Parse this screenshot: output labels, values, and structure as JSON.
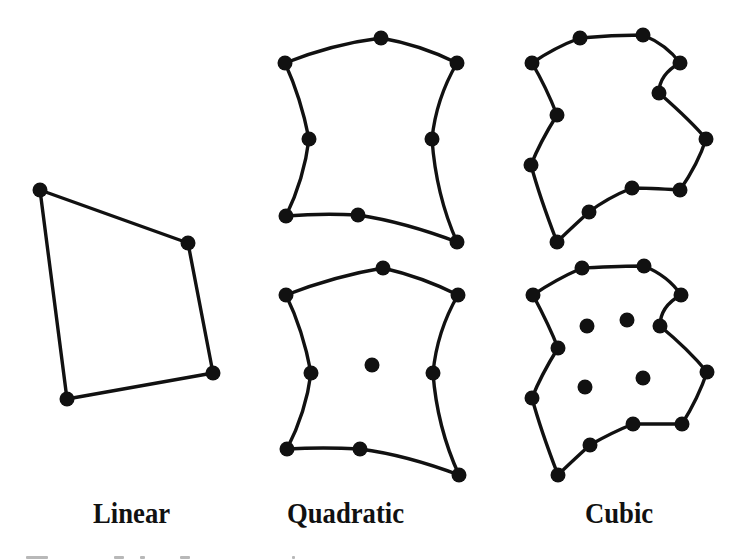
{
  "figure": {
    "stroke_color": "#111111",
    "node_color": "#111111",
    "background": "#ffffff",
    "labels": {
      "linear": "Linear",
      "quadratic": "Quadratic",
      "cubic": "Cubic"
    },
    "caption_visible": "partially cut off (illegible)"
  },
  "elements": {
    "linear": {
      "name": "Linear element (4 nodes)",
      "boundary": "40,190 188,243 213,373 67,399",
      "nodes": [
        [
          40,
          190
        ],
        [
          188,
          243
        ],
        [
          213,
          373
        ],
        [
          67,
          399
        ]
      ]
    },
    "quadratic_serendipity": {
      "name": "Quadratic element (8 nodes)",
      "boundary_path": "M285,63 Q333,44 381,38 Q421,45 457,63 Q436,99 432,139 Q436,195 457,242 Q404,222 358,215 Q322,213 286,216 Q304,179 309,139 Q301,98 285,63 Z",
      "nodes": [
        [
          285,
          63
        ],
        [
          381,
          38
        ],
        [
          457,
          63
        ],
        [
          309,
          139
        ],
        [
          432,
          139
        ],
        [
          286,
          216
        ],
        [
          358,
          215
        ],
        [
          457,
          242
        ]
      ],
      "interior_nodes": []
    },
    "quadratic_lagrange": {
      "name": "Quadratic element (9 nodes)",
      "boundary_path": "M286,295 Q335,276 383,268 Q422,277 458,295 Q437,331 433,373 Q437,427 459,475 Q406,455 360,449 Q323,447 287,449 Q306,412 311,373 Q303,330 286,295 Z",
      "nodes": [
        [
          286,
          295
        ],
        [
          383,
          268
        ],
        [
          458,
          295
        ],
        [
          311,
          373
        ],
        [
          433,
          373
        ],
        [
          287,
          449
        ],
        [
          360,
          449
        ],
        [
          459,
          475
        ]
      ],
      "interior_nodes": [
        [
          372,
          365
        ]
      ]
    },
    "cubic_serendipity": {
      "name": "Cubic element (12 nodes)",
      "boundary_path": "M532,63 C548,52 564,44 580,38 C601,36 622,35 643,35 C660,42 672,52 680,63 C667,70 659,80 659,93 C676,108 692,122 706,139 C700,158 691,174 680,190 C664,189 648,188 632,188 C617,194 602,202 589,212 C578,222 567,232 557,242 C547,216 538,191 531,165 C538,147 547,131 557,115 C550,97 542,80 532,63 Z",
      "nodes": [
        [
          532,
          63
        ],
        [
          580,
          38
        ],
        [
          643,
          35
        ],
        [
          680,
          63
        ],
        [
          659,
          93
        ],
        [
          706,
          139
        ],
        [
          680,
          190
        ],
        [
          632,
          188
        ],
        [
          589,
          212
        ],
        [
          557,
          242
        ],
        [
          531,
          165
        ],
        [
          557,
          115
        ]
      ],
      "interior_nodes": []
    },
    "cubic_lagrange": {
      "name": "Cubic element (16 nodes)",
      "boundary_path": "M533,295 C549,284 566,275 582,268 C603,267 623,266 644,266 C661,273 673,283 681,295 C668,302 660,313 660,326 C677,340 693,355 707,372 C701,390 692,408 682,424 C666,424 649,424 633,424 C618,430 604,437 590,445 C579,455 568,465 558,475 C548,449 539,424 532,398 C539,380 548,364 558,348 C551,330 542,312 533,295 Z",
      "nodes": [
        [
          533,
          295
        ],
        [
          582,
          268
        ],
        [
          644,
          266
        ],
        [
          681,
          295
        ],
        [
          660,
          326
        ],
        [
          707,
          372
        ],
        [
          682,
          424
        ],
        [
          633,
          424
        ],
        [
          590,
          445
        ],
        [
          558,
          475
        ],
        [
          532,
          398
        ],
        [
          558,
          348
        ]
      ],
      "interior_nodes": [
        [
          587,
          326
        ],
        [
          627,
          320
        ],
        [
          585,
          387
        ],
        [
          643,
          378
        ]
      ]
    }
  }
}
